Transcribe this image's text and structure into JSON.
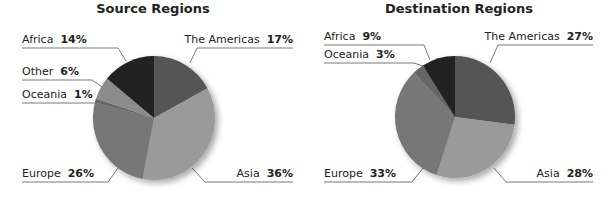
{
  "chart_data": [
    {
      "type": "pie",
      "title": "Source Regions",
      "categories": [
        "The Americas",
        "Asia",
        "Europe",
        "Oceania",
        "Other",
        "Africa"
      ],
      "values": [
        17,
        36,
        26,
        1,
        6,
        14
      ],
      "labels": [
        "The Americas 17%",
        "Asia 36%",
        "Europe 26%",
        "Oceania 1%",
        "Other 6%",
        "Africa 14%"
      ],
      "colors": [
        "#555555",
        "#9a9a9a",
        "#777777",
        "#666666",
        "#8c8c8c",
        "#222222"
      ]
    },
    {
      "type": "pie",
      "title": "Destination Regions",
      "categories": [
        "The Americas",
        "Asia",
        "Europe",
        "Oceania",
        "Africa"
      ],
      "values": [
        27,
        28,
        33,
        3,
        9
      ],
      "labels": [
        "The Americas 27%",
        "Asia 28%",
        "Europe 33%",
        "Oceania 3%",
        "Africa 9%"
      ],
      "colors": [
        "#555555",
        "#9a9a9a",
        "#777777",
        "#666666",
        "#222222"
      ]
    }
  ],
  "source": {
    "title": "Source Regions",
    "labels": {
      "americas": {
        "name": "The Americas",
        "pct": "17%"
      },
      "asia": {
        "name": "Asia",
        "pct": "36%"
      },
      "europe": {
        "name": "Europe",
        "pct": "26%"
      },
      "oceania": {
        "name": "Oceania",
        "pct": "1%"
      },
      "other": {
        "name": "Other",
        "pct": "6%"
      },
      "africa": {
        "name": "Africa",
        "pct": "14%"
      }
    }
  },
  "destination": {
    "title": "Destination Regions",
    "labels": {
      "americas": {
        "name": "The Americas",
        "pct": "27%"
      },
      "asia": {
        "name": "Asia",
        "pct": "28%"
      },
      "europe": {
        "name": "Europe",
        "pct": "33%"
      },
      "oceania": {
        "name": "Oceania",
        "pct": "3%"
      },
      "africa": {
        "name": "Africa",
        "pct": "9%"
      }
    }
  }
}
